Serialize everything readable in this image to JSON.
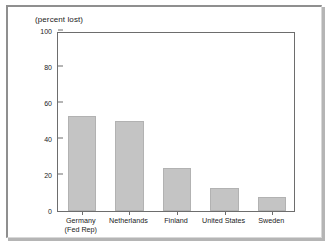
{
  "chart_data": {
    "type": "bar",
    "title": "(percent lost)",
    "xlabel": "",
    "ylabel": "",
    "ylim": [
      0,
      100
    ],
    "yticks": [
      0,
      20,
      40,
      60,
      80,
      100
    ],
    "ytick_labels": [
      "0",
      "20",
      "40",
      "60",
      "80",
      "100"
    ],
    "grid": false,
    "legend": false,
    "bar_color": "#c4c4c4",
    "axis_color": "#6d6d6d",
    "categories": [
      "Germany (Fed Rep)",
      "Netherlands",
      "Finland",
      "United States",
      "Sweden"
    ],
    "category_lines": [
      [
        "Germany",
        "(Fed Rep)"
      ],
      [
        "Netherlands",
        ""
      ],
      [
        "Finland",
        ""
      ],
      [
        "United States",
        ""
      ],
      [
        "Sweden",
        ""
      ]
    ],
    "values": [
      53,
      50,
      24,
      13,
      8
    ]
  }
}
